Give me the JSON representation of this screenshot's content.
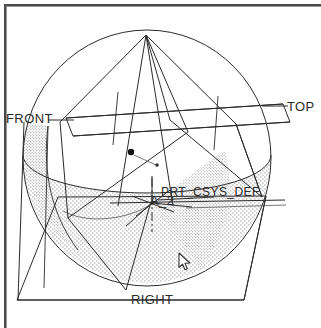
{
  "viewport": {
    "width": 321,
    "height": 328,
    "background_color": "#ffffff",
    "line_color": "#2b2b2b",
    "shade_color": "#8a8a8a",
    "frame_color": "#4a4a4a"
  },
  "labels": {
    "front_plane": "FRONT",
    "top_plane": "TOP",
    "right_plane": "RIGHT",
    "coordinate_system": "PRT_CSYS_DEF",
    "axis": "A_2"
  },
  "model": {
    "description": "Hemispherical bowl wireframe with three datum planes, a datum axis, a datum coordinate system and two datum points",
    "datum_points": [
      {
        "name": "datum-point-filled",
        "x": 131,
        "y": 152,
        "radius": 3.2,
        "filled": true
      },
      {
        "name": "datum-point-small",
        "x": 157,
        "y": 165,
        "radius": 1.8,
        "filled": true
      }
    ],
    "circle_outline": {
      "cx": 147,
      "cy": 158,
      "rx": 124,
      "ry": 128
    },
    "bowl_rim": {
      "cx": 147,
      "cy": 155,
      "rx": 124,
      "ry": 38
    },
    "csys_origin": {
      "x": 152,
      "y": 203
    },
    "apex": {
      "x": 146,
      "y": 35
    }
  },
  "cursor": {
    "icon": "arrow-pointer-icon",
    "x": 178,
    "y": 252
  }
}
